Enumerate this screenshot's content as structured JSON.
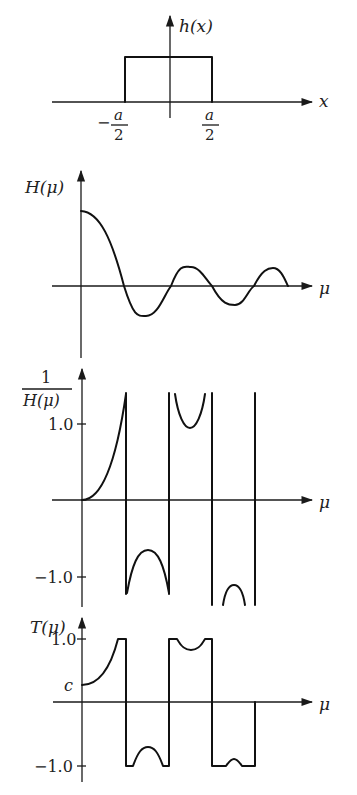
{
  "panels": {
    "rect": {
      "ylabel": "h(x)",
      "xlabel": "x",
      "left_tick_sign": "−",
      "tick_num": "a",
      "tick_den": "2"
    },
    "transfer": {
      "ylabel": "H(μ)",
      "xlabel": "μ"
    },
    "inverse": {
      "ylabel_num": "1",
      "ylabel_den": "H(μ)",
      "xlabel": "μ",
      "tick_pos": "1.0",
      "tick_neg": "−1.0"
    },
    "clipped": {
      "ylabel": "T(μ)",
      "xlabel": "μ",
      "tick_pos": "1.0",
      "tick_neg": "−1.0",
      "tick_c": "c"
    }
  },
  "colors": {
    "ink": "#1a1a1a",
    "background": "#ffffff"
  }
}
